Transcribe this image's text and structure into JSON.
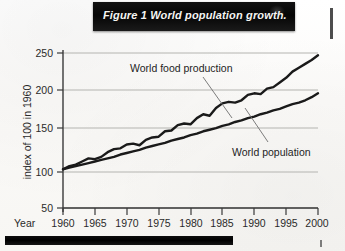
{
  "figure": {
    "banner_title": "Figure 1 World population growth."
  },
  "chart_data": {
    "type": "line",
    "title": "Figure 1 World population growth.",
    "xlabel": "Year",
    "ylabel": "index of 100 in 1960",
    "xlim": [
      1960,
      2000
    ],
    "ylim": [
      50,
      250
    ],
    "grid": true,
    "legend": "inline-annotations",
    "xticks": [
      1960,
      1965,
      1970,
      1975,
      1980,
      1985,
      1990,
      1995,
      2000
    ],
    "yticks": [
      50,
      100,
      150,
      200,
      250
    ],
    "x": [
      1960,
      1961,
      1962,
      1963,
      1964,
      1965,
      1966,
      1967,
      1968,
      1969,
      1970,
      1971,
      1972,
      1973,
      1974,
      1975,
      1976,
      1977,
      1978,
      1979,
      1980,
      1981,
      1982,
      1983,
      1984,
      1985,
      1986,
      1987,
      1988,
      1989,
      1990,
      1991,
      1992,
      1993,
      1994,
      1995,
      1996,
      1997,
      1998,
      1999,
      2000
    ],
    "series": [
      {
        "name": "World food production",
        "annotation": "World food production",
        "values": [
          100,
          104,
          106,
          110,
          114,
          113,
          116,
          122,
          126,
          127,
          132,
          133,
          131,
          138,
          141,
          142,
          149,
          150,
          157,
          159,
          158,
          166,
          171,
          169,
          179,
          185,
          187,
          186,
          189,
          196,
          198,
          197,
          204,
          206,
          212,
          218,
          226,
          231,
          236,
          241,
          247
        ]
      },
      {
        "name": "World population",
        "annotation": "World population",
        "values": [
          100,
          102,
          104,
          106,
          108,
          110,
          112,
          114,
          116,
          119,
          121,
          123,
          125,
          128,
          130,
          132,
          134,
          137,
          139,
          141,
          144,
          146,
          149,
          151,
          153,
          156,
          158,
          161,
          163,
          166,
          168,
          171,
          173,
          176,
          178,
          181,
          184,
          186,
          189,
          193,
          198
        ]
      }
    ]
  },
  "axes": {
    "y_label": "index of 100 in 1960",
    "x_label": "Year",
    "y_ticks": [
      "250",
      "200",
      "150",
      "100",
      "50"
    ],
    "x_ticks": [
      "1960",
      "1965",
      "1970",
      "1975",
      "1980",
      "1985",
      "1990",
      "1995",
      "2000"
    ]
  },
  "annotations": {
    "food": "World food production",
    "population": "World population"
  },
  "colors": {
    "banner_bg": "#0a0a0a",
    "banner_text": "#f4f4f2",
    "line": "#1a1a1a",
    "grid": "#b9b9b5",
    "axis": "#3a3a3a",
    "page_bg": "#fdfdfb"
  }
}
